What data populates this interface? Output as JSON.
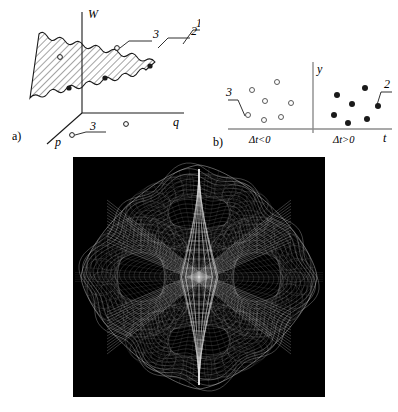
{
  "figure": {
    "title_visible": false,
    "background_color": "#ffffff",
    "ink_color": "#1a1a1a",
    "panels": [
      "a",
      "b",
      "c"
    ]
  },
  "panel_a": {
    "label": "a)",
    "axes": {
      "vertical": "W",
      "horizontal": "q",
      "depth": "p"
    },
    "callouts": [
      {
        "id": "1",
        "text": "1"
      },
      {
        "id": "2",
        "text": "2"
      },
      {
        "id": "3",
        "text": "3"
      },
      {
        "id": "3b",
        "text": "3"
      }
    ],
    "region": {
      "name": "hatched-wavy-region",
      "fill": "diagonal-hatch",
      "border": "wavy"
    },
    "markers": {
      "filled_dot_label": "filled-dot",
      "open_circle_label": "open-circle",
      "filled_dots": [
        {
          "x": 69,
          "y": 88
        },
        {
          "x": 105,
          "y": 78
        },
        {
          "x": 150,
          "y": 66
        }
      ],
      "open_circles": [
        {
          "x": 60,
          "y": 57
        },
        {
          "x": 117,
          "y": 48
        },
        {
          "x": 126,
          "y": 124
        },
        {
          "x": 72,
          "y": 135
        }
      ]
    }
  },
  "panel_b": {
    "label": "b)",
    "axes": {
      "vertical": "y",
      "horizontal": "t"
    },
    "regions": [
      {
        "id": "left",
        "text": "Δt<0",
        "marker": "open-circle"
      },
      {
        "id": "right",
        "text": "Δt>0",
        "marker": "filled-dot"
      }
    ],
    "callouts": [
      {
        "id": "3",
        "text": "3"
      },
      {
        "id": "2",
        "text": "2"
      }
    ],
    "open_circles": [
      {
        "x": 252,
        "y": 90
      },
      {
        "x": 277,
        "y": 82
      },
      {
        "x": 265,
        "y": 101
      },
      {
        "x": 291,
        "y": 103
      },
      {
        "x": 248,
        "y": 115
      },
      {
        "x": 264,
        "y": 120
      },
      {
        "x": 281,
        "y": 117
      }
    ],
    "filled_dots": [
      {
        "x": 337,
        "y": 95
      },
      {
        "x": 365,
        "y": 88
      },
      {
        "x": 352,
        "y": 104
      },
      {
        "x": 378,
        "y": 106
      },
      {
        "x": 334,
        "y": 115
      },
      {
        "x": 348,
        "y": 123
      },
      {
        "x": 367,
        "y": 119
      }
    ]
  },
  "panel_c": {
    "label": "",
    "background_color": "#000000",
    "line_color": "#e8e8e8",
    "description": "wireframe-surface-plot",
    "bounds": {
      "x": 73,
      "y": 157,
      "width": 252,
      "height": 240
    }
  },
  "chart_data": {
    "type": "line",
    "title": "",
    "xlabel": "",
    "ylabel": "",
    "subplots": [
      {
        "id": "a",
        "type": "scatter",
        "title": "a)",
        "xlabel": "q",
        "ylabel": "W",
        "zlabel": "p",
        "series": [
          {
            "name": "filled-dot",
            "marker": "filled",
            "points": [
              [
                69,
                88
              ],
              [
                105,
                78
              ],
              [
                150,
                66
              ]
            ]
          },
          {
            "name": "open-circle",
            "marker": "open",
            "points": [
              [
                60,
                57
              ],
              [
                117,
                48
              ],
              [
                126,
                124
              ],
              [
                72,
                135
              ]
            ]
          }
        ],
        "annotations": [
          "1",
          "2",
          "3",
          "3"
        ],
        "grid": false,
        "legend": "none"
      },
      {
        "id": "b",
        "type": "scatter",
        "title": "b)",
        "xlabel": "t",
        "ylabel": "y",
        "categories": [
          "Δt<0",
          "Δt>0"
        ],
        "series": [
          {
            "name": "Δt<0",
            "marker": "open",
            "count": 7
          },
          {
            "name": "Δt>0",
            "marker": "filled",
            "count": 7
          }
        ],
        "annotations": [
          "3",
          "2"
        ],
        "grid": false,
        "legend": "none"
      },
      {
        "id": "c",
        "type": "line",
        "title": "",
        "description": "wireframe-surface-plot",
        "grid": false,
        "legend": "none"
      }
    ]
  }
}
